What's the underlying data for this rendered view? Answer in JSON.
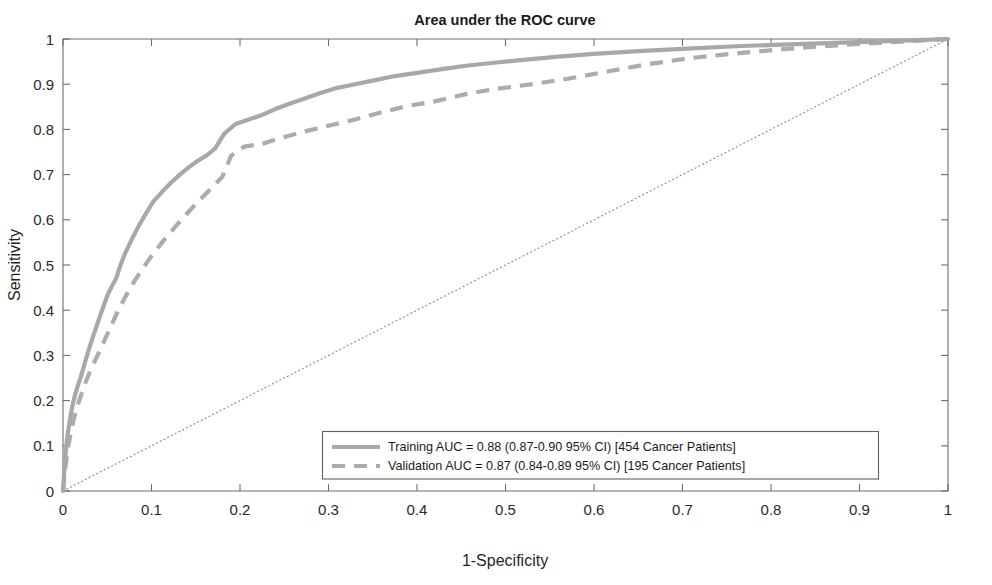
{
  "chart_data": {
    "type": "line",
    "title": "Area under the ROC curve",
    "xlabel": "1-Specificity",
    "ylabel": "Sensitivity",
    "xlim": [
      0,
      1
    ],
    "ylim": [
      0,
      1
    ],
    "grid": false,
    "legend_position": "bottom-center",
    "xticks": [
      "0",
      "0.1",
      "0.2",
      "0.3",
      "0.4",
      "0.5",
      "0.6",
      "0.7",
      "0.8",
      "0.9",
      "1"
    ],
    "yticks": [
      "0",
      "0.1",
      "0.2",
      "0.3",
      "0.4",
      "0.5",
      "0.6",
      "0.7",
      "0.8",
      "0.9",
      "1"
    ],
    "xtick_values": [
      0,
      0.1,
      0.2,
      0.3,
      0.4,
      0.5,
      0.6,
      0.7,
      0.8,
      0.9,
      1
    ],
    "ytick_values": [
      0,
      0.1,
      0.2,
      0.3,
      0.4,
      0.5,
      0.6,
      0.7,
      0.8,
      0.9,
      1
    ],
    "series": [
      {
        "name": "Training",
        "label": "Training AUC = 0.88 (0.87-0.90 95% CI) [454 Cancer Patients]",
        "auc": 0.88,
        "ci_low": 0.87,
        "ci_high": 0.9,
        "ci_level": "95% CI",
        "n_patients": 454,
        "style": "solid",
        "color": "#a8a8a8",
        "x": [
          0.0,
          0.002,
          0.004,
          0.006,
          0.008,
          0.01,
          0.012,
          0.014,
          0.016,
          0.018,
          0.02,
          0.023,
          0.026,
          0.03,
          0.034,
          0.038,
          0.042,
          0.046,
          0.05,
          0.055,
          0.06,
          0.065,
          0.07,
          0.078,
          0.086,
          0.094,
          0.102,
          0.112,
          0.122,
          0.132,
          0.142,
          0.152,
          0.162,
          0.172,
          0.182,
          0.195,
          0.21,
          0.225,
          0.24,
          0.255,
          0.27,
          0.29,
          0.31,
          0.33,
          0.35,
          0.375,
          0.4,
          0.43,
          0.46,
          0.49,
          0.52,
          0.56,
          0.6,
          0.65,
          0.7,
          0.76,
          0.82,
          0.88,
          0.94,
          0.975,
          1.0
        ],
        "y": [
          0.0,
          0.06,
          0.105,
          0.135,
          0.16,
          0.182,
          0.2,
          0.215,
          0.228,
          0.24,
          0.252,
          0.272,
          0.292,
          0.318,
          0.342,
          0.365,
          0.388,
          0.41,
          0.432,
          0.452,
          0.47,
          0.5,
          0.525,
          0.558,
          0.588,
          0.615,
          0.64,
          0.662,
          0.682,
          0.7,
          0.716,
          0.73,
          0.742,
          0.758,
          0.79,
          0.812,
          0.822,
          0.832,
          0.845,
          0.856,
          0.866,
          0.88,
          0.892,
          0.9,
          0.908,
          0.918,
          0.925,
          0.934,
          0.942,
          0.948,
          0.954,
          0.961,
          0.967,
          0.973,
          0.978,
          0.984,
          0.988,
          0.992,
          0.996,
          0.998,
          1.0
        ]
      },
      {
        "name": "Validation",
        "label": "Validation AUC = 0.87 (0.84-0.89 95% CI) [195 Cancer Patients]",
        "auc": 0.87,
        "ci_low": 0.84,
        "ci_high": 0.89,
        "ci_level": "95% CI",
        "n_patients": 195,
        "style": "dashed",
        "color": "#acacac",
        "x": [
          0.0,
          0.003,
          0.006,
          0.009,
          0.012,
          0.016,
          0.02,
          0.025,
          0.03,
          0.036,
          0.042,
          0.048,
          0.055,
          0.062,
          0.07,
          0.08,
          0.09,
          0.1,
          0.112,
          0.124,
          0.136,
          0.15,
          0.165,
          0.18,
          0.19,
          0.205,
          0.225,
          0.248,
          0.272,
          0.3,
          0.33,
          0.36,
          0.39,
          0.42,
          0.455,
          0.49,
          0.53,
          0.57,
          0.615,
          0.66,
          0.71,
          0.77,
          0.83,
          0.89,
          0.945,
          0.98,
          1.0
        ],
        "y": [
          0.0,
          0.058,
          0.1,
          0.132,
          0.158,
          0.186,
          0.21,
          0.238,
          0.262,
          0.288,
          0.312,
          0.338,
          0.368,
          0.398,
          0.428,
          0.462,
          0.492,
          0.52,
          0.55,
          0.578,
          0.605,
          0.635,
          0.665,
          0.695,
          0.742,
          0.762,
          0.768,
          0.782,
          0.795,
          0.808,
          0.822,
          0.838,
          0.852,
          0.862,
          0.878,
          0.89,
          0.9,
          0.912,
          0.928,
          0.944,
          0.958,
          0.97,
          0.98,
          0.988,
          0.994,
          0.998,
          1.0
        ]
      }
    ],
    "reference_line": {
      "name": "chance-diagonal",
      "from": [
        0,
        0
      ],
      "to": [
        1,
        1
      ],
      "style": "dotted",
      "color": "#8a8a93"
    }
  },
  "colors": {
    "background": "#ffffff",
    "axis": "#6d6d6d",
    "text": "#1a1a1a",
    "training": "#a8a8a8",
    "validation": "#acacac",
    "diagonal": "#8a8a93",
    "legend_border": "#5f5f5f"
  }
}
